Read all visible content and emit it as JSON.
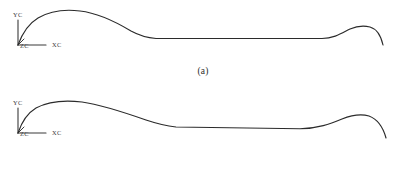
{
  "figure": {
    "background_color": "#ffffff",
    "line_color": "#2b2b2b",
    "axis_color": "#3a3a3a",
    "text_color": "#3a3a3a"
  },
  "panels": [
    {
      "id": "a",
      "caption": "(a)",
      "axes": {
        "y_label": "YC",
        "x_label": "XC",
        "z_label": "ZC",
        "origin_x": 18,
        "origin_y": 45
      },
      "curve_path": "M 18,45 C 22,34 28,24 38,18 C 50,11 64,9 80,11 C 98,13 116,22 131,31 C 142,37 149,38 156,38.5 L 322,38.5 C 334,38.5 342,33 350,29 C 357,26 364,25.5 370,27 C 377,29 381,36 383,45"
    },
    {
      "id": "b",
      "caption": "(b)",
      "axes": {
        "y_label": "YC",
        "x_label": "XC",
        "z_label": "ZC",
        "origin_x": 18,
        "origin_y": 133
      },
      "curve_path": "M 18,133 C 21,124 26,114 36,108 C 49,101 65,100 82,102 C 103,105 126,113 146,120 C 158,124 167,126 176,127 L 300,128.8 C 318,128.5 330,124 342,119 C 352,115 362,114 369,116 C 377,119 383,127 386,138"
    }
  ],
  "chart_data": {
    "type": "line",
    "title": "",
    "subtitle": "",
    "xlabel": "XC",
    "ylabel": "YC",
    "zlabel": "ZC",
    "grid": false,
    "legend": "none",
    "annotations": [
      "(a)",
      "(b)"
    ],
    "series": [
      {
        "name": "(a)",
        "x": [
          18,
          26,
          34,
          42,
          50,
          60,
          70,
          80,
          90,
          100,
          110,
          120,
          130,
          140,
          150,
          160,
          200,
          240,
          280,
          310,
          322,
          332,
          342,
          352,
          362,
          370,
          376,
          380,
          383
        ],
        "y": [
          45,
          27,
          21,
          17.5,
          14.5,
          12,
          10.8,
          10.7,
          11.5,
          13.5,
          17,
          21.5,
          27,
          32.5,
          36.5,
          38.2,
          38.5,
          38.5,
          38.5,
          38.5,
          38.3,
          35,
          31,
          28,
          26,
          26.2,
          30,
          37,
          45
        ]
      },
      {
        "name": "(b)",
        "x": [
          18,
          26,
          34,
          42,
          50,
          60,
          70,
          80,
          90,
          100,
          115,
          130,
          145,
          160,
          176,
          200,
          240,
          280,
          300,
          320,
          332,
          344,
          356,
          366,
          372,
          380,
          386
        ],
        "y": [
          133,
          118,
          112,
          108,
          105.5,
          103,
          101.8,
          101.5,
          102,
          103.5,
          107,
          111,
          116,
          122,
          126.8,
          127.4,
          128.1,
          128.8,
          128.8,
          127,
          123,
          119,
          116,
          114.8,
          115.4,
          124,
          138
        ]
      }
    ],
    "xlim": [
      0,
      406
    ],
    "ylim": [
      0,
      88
    ]
  }
}
